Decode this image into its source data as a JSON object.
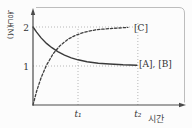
{
  "colors": {
    "axis": "#4a4a4a",
    "curve": "#3a3a3a",
    "dashed_curve": "#3f3f3f",
    "guide": "#a6a6a6",
    "frame": "#bdbdbd",
    "text": "#333333",
    "background": "#fcfcfc"
  },
  "chart_data": {
    "type": "line",
    "title": "",
    "xlabel": "시간",
    "ylabel": "농도(M)",
    "ylabel_stack": [
      "농",
      "도",
      "(M)"
    ],
    "xlim": [
      0,
      3.4
    ],
    "ylim": [
      0,
      2.45
    ],
    "x_unit_note": "time axis unlabeled numerically; marks at t₁ and t₂",
    "y_ticks": [
      {
        "value": 2,
        "label": "2"
      },
      {
        "value": 1,
        "label": "1"
      }
    ],
    "x_ticks": [
      {
        "value": 1,
        "label": "t₁"
      },
      {
        "value": 2.33,
        "label": "t₂"
      }
    ],
    "legend_position": "labels at right end of each curve",
    "grid": "dotted guide lines at y=1, y=2 and vertical dotted lines at t₁, t₂",
    "series": [
      {
        "name": "[A], [B]",
        "line_style": "solid",
        "color": "#3a3a3a",
        "description": "reactant concentration decreasing from 2 M to equilibrium 1 M",
        "points": [
          [
            0,
            2
          ],
          [
            0.08,
            1.87
          ],
          [
            0.18,
            1.72
          ],
          [
            0.3,
            1.58
          ],
          [
            0.42,
            1.47
          ],
          [
            0.55,
            1.37
          ],
          [
            0.7,
            1.28
          ],
          [
            0.85,
            1.21
          ],
          [
            1.0,
            1.16
          ],
          [
            1.2,
            1.11
          ],
          [
            1.45,
            1.07
          ],
          [
            1.7,
            1.05
          ],
          [
            2.0,
            1.03
          ],
          [
            2.31,
            1.02
          ]
        ]
      },
      {
        "name": "[C]",
        "line_style": "dashed",
        "color": "#3f3f3f",
        "description": "product concentration increasing from 0 M to equilibrium 2 M",
        "points": [
          [
            0,
            0
          ],
          [
            0.08,
            0.35
          ],
          [
            0.18,
            0.7
          ],
          [
            0.3,
            1.02
          ],
          [
            0.45,
            1.32
          ],
          [
            0.6,
            1.52
          ],
          [
            0.78,
            1.69
          ],
          [
            0.95,
            1.79
          ],
          [
            1.15,
            1.87
          ],
          [
            1.4,
            1.93
          ],
          [
            1.7,
            1.96
          ],
          [
            2.11,
            1.99
          ]
        ]
      }
    ],
    "guides": {
      "horizontal": [
        {
          "y": 1,
          "t_start": 0,
          "t_end": 2.33
        },
        {
          "y": 2,
          "t_start": 0,
          "t_end": 2.33
        }
      ],
      "vertical": [
        {
          "t": 1,
          "v_bottom": 0,
          "v_top": 2
        },
        {
          "t": 2.33,
          "v_bottom": 0,
          "v_top": 2.12
        }
      ]
    }
  }
}
